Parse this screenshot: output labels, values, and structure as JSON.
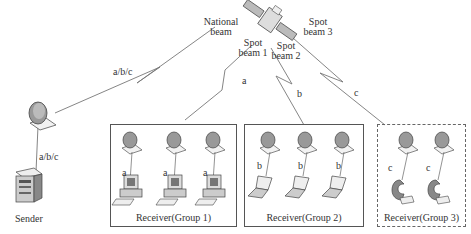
{
  "diagram": {
    "satellite": {
      "icon": "satellite-icon"
    },
    "beams": {
      "national": "National\nbeam",
      "national_l1": "National",
      "national_l2": "beam",
      "spot1_l1": "Spot",
      "spot1_l2": "beam 1",
      "spot2_l1": "Spot",
      "spot2_l2": "beam 2",
      "spot3_l1": "Spot",
      "spot3_l2": "beam 3"
    },
    "links": {
      "uplink": "a/b/c",
      "sender_link": "a/b/c",
      "beam1": "a",
      "beam2": "b",
      "beam3": "c"
    },
    "sender": {
      "label": "Sender"
    },
    "groups": [
      {
        "label": "Receiver(Group 1)",
        "channel": "a",
        "device": "desktop-computer",
        "count": 3,
        "border": "solid"
      },
      {
        "label": "Receiver(Group 2)",
        "channel": "b",
        "device": "laptop",
        "count": 3,
        "border": "solid"
      },
      {
        "label": "Receiver(Group 3)",
        "channel": "c",
        "device": "mobile-terminal",
        "count": 2,
        "border": "dashed"
      }
    ],
    "colors": {
      "line": "#777777",
      "border": "#555555",
      "text": "#333333",
      "dish": "#9a9a9a"
    }
  }
}
